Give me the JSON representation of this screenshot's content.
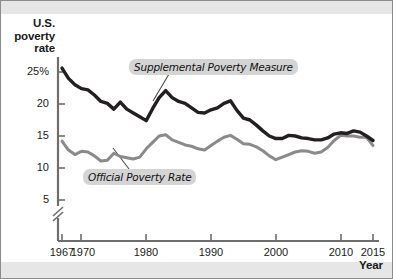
{
  "figure": {
    "background_color": "#ffffff",
    "band_color": "#e6e6e6",
    "border_color": "#8c8c8c"
  },
  "axis": {
    "y_title": "U.S. poverty rate",
    "y_title_line1": "U.S.",
    "y_title_line2": "poverty",
    "y_title_line3": "rate",
    "x_title": "Year",
    "y_ticks": [
      "25%",
      "20",
      "15",
      "10",
      "5"
    ],
    "x_ticks": [
      "1967",
      "1970",
      "1980",
      "1990",
      "2000",
      "2010",
      "2015"
    ],
    "break_symbol": "axis-break-slashes"
  },
  "callouts": {
    "supplemental": "Supplemental Poverty Measure",
    "official": "Official Poverty Rate"
  },
  "colors": {
    "supplemental_line": "#231f20",
    "official_line": "#8a8a8a",
    "axis": "#6e6e6e",
    "callout_bg": "#d4d4d4",
    "leader_line": "#4d4d4d"
  },
  "chart_data": {
    "type": "line",
    "title": "U.S. poverty rate",
    "xlabel": "Year",
    "ylabel": "U.S. poverty rate",
    "xlim": [
      1967,
      2015
    ],
    "ylim": [
      4.5,
      26.5
    ],
    "yticks": [
      5,
      10,
      15,
      20,
      25
    ],
    "xticks": [
      1967,
      1970,
      1980,
      1990,
      2000,
      2010,
      2015
    ],
    "grid": false,
    "legend": "inline-callout-labels",
    "y_axis_break": true,
    "x": [
      1967,
      1968,
      1969,
      1970,
      1971,
      1972,
      1973,
      1974,
      1975,
      1976,
      1977,
      1978,
      1979,
      1980,
      1981,
      1982,
      1983,
      1984,
      1985,
      1986,
      1987,
      1988,
      1989,
      1990,
      1991,
      1992,
      1993,
      1994,
      1995,
      1996,
      1997,
      1998,
      1999,
      2000,
      2001,
      2002,
      2003,
      2004,
      2005,
      2006,
      2007,
      2008,
      2009,
      2010,
      2011,
      2012,
      2013,
      2014,
      2015
    ],
    "series": [
      {
        "name": "Supplemental Poverty Measure",
        "color": "#231f20",
        "values": [
          25.6,
          24.0,
          23.0,
          22.4,
          22.2,
          21.4,
          20.4,
          20.1,
          19.2,
          20.3,
          19.2,
          18.6,
          18.0,
          17.4,
          19.3,
          21.0,
          22.1,
          21.0,
          20.4,
          20.1,
          19.4,
          18.7,
          18.6,
          19.1,
          19.4,
          20.1,
          20.5,
          19.0,
          17.8,
          17.5,
          16.7,
          15.8,
          15.0,
          14.6,
          14.6,
          15.1,
          15.0,
          14.7,
          14.6,
          14.4,
          14.4,
          14.7,
          15.3,
          15.5,
          15.4,
          15.8,
          15.6,
          15.0,
          14.3
        ]
      },
      {
        "name": "Official Poverty Rate",
        "color": "#8a8a8a",
        "values": [
          14.2,
          12.8,
          12.1,
          12.6,
          12.5,
          11.9,
          11.1,
          11.2,
          12.3,
          11.8,
          11.6,
          11.4,
          11.7,
          13.0,
          14.0,
          15.0,
          15.2,
          14.4,
          14.0,
          13.6,
          13.4,
          13.0,
          12.8,
          13.5,
          14.2,
          14.8,
          15.1,
          14.5,
          13.8,
          13.7,
          13.3,
          12.7,
          11.9,
          11.3,
          11.7,
          12.1,
          12.5,
          12.7,
          12.6,
          12.3,
          12.5,
          13.2,
          14.3,
          15.1,
          15.0,
          15.0,
          14.8,
          14.8,
          13.5
        ]
      }
    ]
  }
}
